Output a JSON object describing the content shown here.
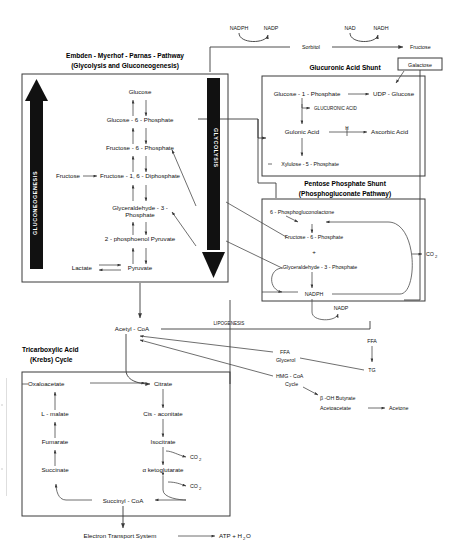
{
  "figure": {
    "background_color": "#ffffff",
    "ink_color": "#3a3a3a"
  },
  "top_sorbitol_pathway": {
    "cofactor_1": "NADPH",
    "cofactor_2": "NADP",
    "intermediate": "Sorbitol",
    "cofactor_3": "NAD",
    "cofactor_4": "NADH",
    "product": "Fructose"
  },
  "embden_box": {
    "title_line1": "Embden - Myerhof - Parnas - Pathway",
    "title_line2": "(Glycolysis and Gluconeogenesis)",
    "left_arrow_label": "GLUCONEOGENESIS",
    "right_arrow_label": "GLYCOLYSIS",
    "metabolites": [
      "Glucose",
      "Glucose - 6 - Phosphate",
      "Fructose - 6 - Phosphate",
      "Fructose - 1,  6 - Diphosphate",
      "Glyceraldehyde - 3 -",
      "Phosphate",
      "2 - phosphoenol Pyruvate",
      "Pyruvate"
    ],
    "side_inputs": {
      "fructose": "Fructose",
      "lactate": "Lactate"
    }
  },
  "glucuronic_box": {
    "title": "Glucuronic Acid Shunt",
    "metabolites": {
      "g1p": "Glucose - 1 - Phosphate",
      "udpg": "UDP - Glucose",
      "glucuronic_acid": "GLUCURONIC ACID",
      "gulonic_acid": "Gulonic Acid",
      "ascorbic_acid": "Ascorbic Acid",
      "blocked_marker": "H",
      "xylulose": "Xylulose - 5 - Phosphate"
    },
    "galactose_box_label": "Galactose"
  },
  "pentose_box": {
    "title_line1": "Pentose Phosphate Shunt",
    "title_line2": "(Phosphogluconate Pathway)",
    "metabolites": {
      "lactone": "6 - Phosphogluconolactone",
      "f6p": "Fructose - 6 - Phosphate",
      "plus": "+",
      "g3p": "Glyceraldehyde - 3 - Phosphate",
      "nadph": "NADPH",
      "co2": "CO",
      "co2_sub": "2"
    },
    "nadp_label": "NADP"
  },
  "lipogenesis": {
    "acetyl_coa": "Acetyl - CoA",
    "pathway_label": "LIPOGENESIS",
    "ffa": "FFA",
    "glycerol": "Glycerol",
    "hmg_line1": "HMG - CoA",
    "hmg_line2": "Cycle",
    "ffa_right": "FFA",
    "tg": "TG",
    "ketone_1": "β -OH Butyrate",
    "ketone_2": "Acetoacetate",
    "ketone_3": "Acetone"
  },
  "krebs_box": {
    "title_line1": "Tricarboxylic Acid",
    "title_line2": "(Krebs) Cycle",
    "metabolites": {
      "oxaloacetate": "Oxaloacetate",
      "l_malate": "L - malate",
      "fumarate": "Fumarate",
      "succinate": "Succinate",
      "succinyl_coa": "Succinyl - CoA",
      "citrate": "Citrate",
      "cis_aconitate": "Cis - aconitate",
      "isocitrate": "Isocitrate",
      "alpha_kg": "α ketoglutarate",
      "co2_a": "CO",
      "co2_a_sub": "2",
      "co2_b": "CO",
      "co2_b_sub": "2"
    }
  },
  "electron_transport": {
    "label": "Electron Transport System",
    "product_pre": "ATP + H",
    "product_sub": "2",
    "product_post": "O"
  }
}
